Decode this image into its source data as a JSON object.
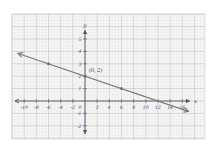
{
  "chart_data": {
    "type": "line",
    "title": "",
    "xlabel": "x",
    "ylabel": "y",
    "xlim": [
      -11,
      17
    ],
    "ylim": [
      -3,
      6
    ],
    "grid": true,
    "x_ticks": [
      -10,
      -8,
      -6,
      -4,
      -2,
      2,
      4,
      6,
      8,
      10,
      12,
      14,
      16
    ],
    "x_tick_labels": [
      "-10",
      "-8",
      "-6",
      "-4",
      "-2",
      "2",
      "4",
      "6",
      "8",
      "10",
      "12",
      "14",
      "16"
    ],
    "y_ticks": [
      5,
      4,
      3,
      2,
      1,
      -1,
      -2
    ],
    "y_tick_labels": [
      "5",
      "4",
      "3",
      "2",
      "1",
      "-1",
      "-2"
    ],
    "origin_label": "0",
    "series": [
      {
        "name": "line",
        "equation": "y = -x/6 + 2",
        "slope": -0.1667,
        "intercept": 2,
        "x": [
          -11,
          17
        ],
        "y": [
          3.83,
          -0.83
        ],
        "arrows": "both"
      }
    ],
    "points": [
      {
        "x": -6,
        "y": 3
      },
      {
        "x": 0,
        "y": 2
      },
      {
        "x": 6,
        "y": 1
      }
    ],
    "annotations": [
      {
        "text": "(0, 2)",
        "x": 0,
        "y": 2
      }
    ],
    "colors": {
      "line": "#7a7a7a",
      "axis": "#555555",
      "grid_major": "#bdbdbd",
      "grid_minor": "#e2e2e2",
      "background": "#f7f7f7"
    }
  }
}
